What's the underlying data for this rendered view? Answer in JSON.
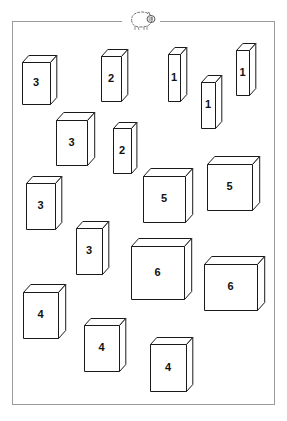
{
  "worksheet": {
    "header_icon": "pig-icon",
    "line_color": "#1a1a1a",
    "frame_color": "#9a9a9a",
    "boxes": [
      {
        "label": "3",
        "x": 22,
        "y": 62,
        "w": 28,
        "h": 42,
        "d": 7
      },
      {
        "label": "2",
        "x": 101,
        "y": 56,
        "w": 20,
        "h": 45,
        "d": 7
      },
      {
        "label": "1",
        "x": 168,
        "y": 54,
        "w": 12,
        "h": 47,
        "d": 7
      },
      {
        "label": "1",
        "x": 201,
        "y": 82,
        "w": 14,
        "h": 46,
        "d": 7
      },
      {
        "label": "1",
        "x": 236,
        "y": 50,
        "w": 13,
        "h": 45,
        "d": 7
      },
      {
        "label": "3",
        "x": 56,
        "y": 120,
        "w": 31,
        "h": 45,
        "d": 8
      },
      {
        "label": "2",
        "x": 113,
        "y": 128,
        "w": 18,
        "h": 45,
        "d": 6
      },
      {
        "label": "3",
        "x": 26,
        "y": 183,
        "w": 29,
        "h": 46,
        "d": 7
      },
      {
        "label": "5",
        "x": 143,
        "y": 176,
        "w": 42,
        "h": 46,
        "d": 8
      },
      {
        "label": "5",
        "x": 207,
        "y": 164,
        "w": 45,
        "h": 46,
        "d": 8
      },
      {
        "label": "3",
        "x": 76,
        "y": 228,
        "w": 26,
        "h": 46,
        "d": 7
      },
      {
        "label": "6",
        "x": 131,
        "y": 246,
        "w": 53,
        "h": 53,
        "d": 8
      },
      {
        "label": "6",
        "x": 204,
        "y": 264,
        "w": 53,
        "h": 46,
        "d": 8
      },
      {
        "label": "4",
        "x": 23,
        "y": 292,
        "w": 35,
        "h": 46,
        "d": 8
      },
      {
        "label": "4",
        "x": 84,
        "y": 325,
        "w": 35,
        "h": 46,
        "d": 7
      },
      {
        "label": "4",
        "x": 150,
        "y": 344,
        "w": 36,
        "h": 47,
        "d": 7
      }
    ]
  }
}
